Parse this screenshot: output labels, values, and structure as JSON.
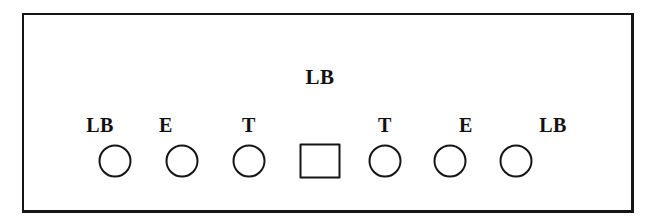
{
  "figure": {
    "type": "tree-diagram",
    "background_color": "#ffffff",
    "stroke_color": "#151515",
    "frame": {
      "name": "outer-frame",
      "x": 22,
      "y": 13,
      "width": 612,
      "height": 200,
      "border_width": 2
    },
    "root": {
      "label": "LB",
      "x": 320,
      "y": 67
    },
    "nodes": [
      {
        "label": "LB",
        "shape": "circle",
        "shape_x": 115,
        "shape_y": 161,
        "label_x": 100,
        "label_y": 115
      },
      {
        "label": "E",
        "shape": "circle",
        "shape_x": 182,
        "shape_y": 161,
        "label_x": 166,
        "label_y": 115
      },
      {
        "label": "T",
        "shape": "circle",
        "shape_x": 249,
        "shape_y": 161,
        "label_x": 249,
        "label_y": 115
      },
      {
        "label": "",
        "shape": "square",
        "shape_x": 320,
        "shape_y": 161,
        "label_x": 320,
        "label_y": 115
      },
      {
        "label": "T",
        "shape": "circle",
        "shape_x": 385,
        "shape_y": 161,
        "label_x": 385,
        "label_y": 115
      },
      {
        "label": "E",
        "shape": "circle",
        "shape_x": 450,
        "shape_y": 161,
        "label_x": 466,
        "label_y": 115
      },
      {
        "label": "LB",
        "shape": "circle",
        "shape_x": 516,
        "shape_y": 161,
        "label_x": 553,
        "label_y": 115
      }
    ]
  }
}
